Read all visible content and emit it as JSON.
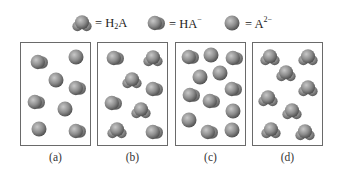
{
  "legend": {
    "items": [
      {
        "species": "H2A",
        "label_prefix": "= H",
        "label_sub": "2",
        "label_suffix": "A",
        "shape": "three-lobed"
      },
      {
        "species": "HA-",
        "label_prefix": "= HA",
        "label_sup": "−",
        "shape": "two-lobed"
      },
      {
        "species": "A2-",
        "label_prefix": "= A",
        "label_sup": "2−",
        "shape": "sphere"
      }
    ]
  },
  "panels": [
    {
      "caption": "(a)",
      "molecules": [
        {
          "t": "HA",
          "x": 18,
          "y": 19
        },
        {
          "t": "A",
          "x": 55,
          "y": 14
        },
        {
          "t": "A",
          "x": 35,
          "y": 37
        },
        {
          "t": "HA",
          "x": 56,
          "y": 45
        },
        {
          "t": "HA",
          "x": 15,
          "y": 59
        },
        {
          "t": "A",
          "x": 44,
          "y": 66
        },
        {
          "t": "A",
          "x": 18,
          "y": 86
        },
        {
          "t": "HA",
          "x": 56,
          "y": 88
        }
      ]
    },
    {
      "caption": "(b)",
      "molecules": [
        {
          "t": "HA",
          "x": 17,
          "y": 15
        },
        {
          "t": "H2A",
          "x": 55,
          "y": 15
        },
        {
          "t": "H2A",
          "x": 34,
          "y": 37
        },
        {
          "t": "HA",
          "x": 56,
          "y": 46
        },
        {
          "t": "HA",
          "x": 15,
          "y": 60
        },
        {
          "t": "H2A",
          "x": 43,
          "y": 67
        },
        {
          "t": "H2A",
          "x": 19,
          "y": 87
        },
        {
          "t": "HA",
          "x": 56,
          "y": 89
        }
      ]
    },
    {
      "caption": "(c)",
      "molecules": [
        {
          "t": "HA",
          "x": 14,
          "y": 14
        },
        {
          "t": "A",
          "x": 35,
          "y": 12
        },
        {
          "t": "HA",
          "x": 58,
          "y": 15
        },
        {
          "t": "A",
          "x": 24,
          "y": 34
        },
        {
          "t": "A",
          "x": 44,
          "y": 30
        },
        {
          "t": "HA",
          "x": 57,
          "y": 46
        },
        {
          "t": "HA",
          "x": 15,
          "y": 52
        },
        {
          "t": "HA",
          "x": 35,
          "y": 58
        },
        {
          "t": "A",
          "x": 57,
          "y": 68
        },
        {
          "t": "A",
          "x": 13,
          "y": 77
        },
        {
          "t": "HA",
          "x": 33,
          "y": 89
        },
        {
          "t": "A",
          "x": 56,
          "y": 87
        }
      ]
    },
    {
      "caption": "(d)",
      "molecules": [
        {
          "t": "H2A",
          "x": 17,
          "y": 14
        },
        {
          "t": "H2A",
          "x": 55,
          "y": 14
        },
        {
          "t": "H2A",
          "x": 33,
          "y": 30
        },
        {
          "t": "H2A",
          "x": 55,
          "y": 45
        },
        {
          "t": "H2A",
          "x": 15,
          "y": 55
        },
        {
          "t": "H2A",
          "x": 39,
          "y": 68
        },
        {
          "t": "H2A",
          "x": 18,
          "y": 87
        },
        {
          "t": "H2A",
          "x": 52,
          "y": 89
        }
      ]
    }
  ]
}
